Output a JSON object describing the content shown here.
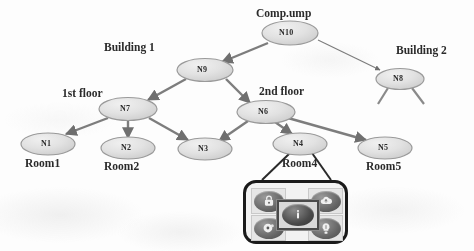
{
  "diagram": {
    "type": "hierarchical-tree",
    "title_node": "Comp.ump",
    "nodes": [
      {
        "id": "N10",
        "tag": "N10",
        "caption": "Comp.ump",
        "caption_pos": "above",
        "x": 290,
        "y": 33
      },
      {
        "id": "N9",
        "tag": "N9",
        "caption": "Building 1",
        "caption_pos": "left-above",
        "x": 205,
        "y": 70
      },
      {
        "id": "N8",
        "tag": "N8",
        "caption": "Building 2",
        "caption_pos": "right-above",
        "x": 400,
        "y": 79
      },
      {
        "id": "N7",
        "tag": "N7",
        "caption": "1st floor",
        "caption_pos": "left-above",
        "x": 128,
        "y": 109
      },
      {
        "id": "N6",
        "tag": "N6",
        "caption": "2nd floor",
        "caption_pos": "right-above",
        "x": 266,
        "y": 112
      },
      {
        "id": "N1",
        "tag": "N1",
        "caption": "Room1",
        "caption_pos": "below",
        "x": 48,
        "y": 144
      },
      {
        "id": "N2",
        "tag": "N2",
        "caption": "Room2",
        "caption_pos": "below",
        "x": 128,
        "y": 148
      },
      {
        "id": "N3",
        "tag": "N3",
        "caption": "",
        "caption_pos": "below",
        "x": 205,
        "y": 149
      },
      {
        "id": "N4",
        "tag": "N4",
        "caption": "Room4",
        "caption_pos": "below",
        "x": 300,
        "y": 144
      },
      {
        "id": "N5",
        "tag": "N5",
        "caption": "Room5",
        "caption_pos": "below",
        "x": 385,
        "y": 148
      }
    ],
    "edges": [
      {
        "from": "N10",
        "to": "N9",
        "arrow": true
      },
      {
        "from": "N10",
        "to": "N8",
        "arrow": true
      },
      {
        "from": "N9",
        "to": "N7",
        "arrow": true
      },
      {
        "from": "N9",
        "to": "N6",
        "arrow": true
      },
      {
        "from": "N7",
        "to": "N1",
        "arrow": true
      },
      {
        "from": "N7",
        "to": "N2",
        "arrow": true
      },
      {
        "from": "N7",
        "to": "N3",
        "arrow": true
      },
      {
        "from": "N6",
        "to": "N3",
        "arrow": true
      },
      {
        "from": "N6",
        "to": "N4",
        "arrow": true
      },
      {
        "from": "N6",
        "to": "N5",
        "arrow": true
      }
    ],
    "stub_edges": [
      {
        "from": "N8",
        "direction": "down-left"
      },
      {
        "from": "N8",
        "direction": "down-right"
      }
    ],
    "colors": {
      "node_fill": "#e0e0e0",
      "node_stroke": "#8f8f8f",
      "edge": "#7a7a7a",
      "text": "#2b2b2b",
      "panel_border": "#1a1a1a",
      "background": "#fdfdfd"
    }
  },
  "icon_panel": {
    "attached_to": "N4",
    "selected_icon": "info-icon",
    "icons": [
      {
        "name": "lock-icon",
        "position": "top-left",
        "glyph": "●"
      },
      {
        "name": "cloud-icon",
        "position": "top-right",
        "glyph": "●"
      },
      {
        "name": "disc-icon",
        "position": "bottom-left",
        "glyph": "●"
      },
      {
        "name": "bulb-icon",
        "position": "bottom-right",
        "glyph": "●"
      },
      {
        "name": "info-icon",
        "position": "center",
        "glyph": "●"
      }
    ]
  }
}
